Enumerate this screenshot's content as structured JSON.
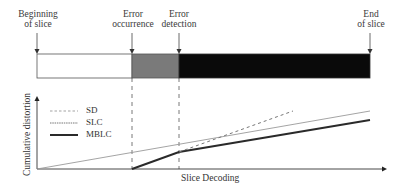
{
  "diagram": {
    "annotations": {
      "beginning": [
        "Beginning",
        "of slice"
      ],
      "occurrence": [
        "Error",
        "occurrence"
      ],
      "detection": [
        "Error",
        "detection"
      ],
      "end": [
        "End",
        "of slice"
      ]
    },
    "slice_bar": {
      "segments": [
        {
          "name": "correct",
          "color": "#ffffff"
        },
        {
          "name": "error-propagation",
          "color": "#7a7a7a"
        },
        {
          "name": "after-detection",
          "color": "#0a0a0a"
        }
      ]
    },
    "axes": {
      "ylabel": "Cumulative distortion",
      "xlabel": "Slice Decoding"
    },
    "legend": [
      {
        "label": "SD",
        "style": "dashed"
      },
      {
        "label": "SLC",
        "style": "thin-solid"
      },
      {
        "label": "MBLC",
        "style": "thick-solid"
      }
    ]
  }
}
